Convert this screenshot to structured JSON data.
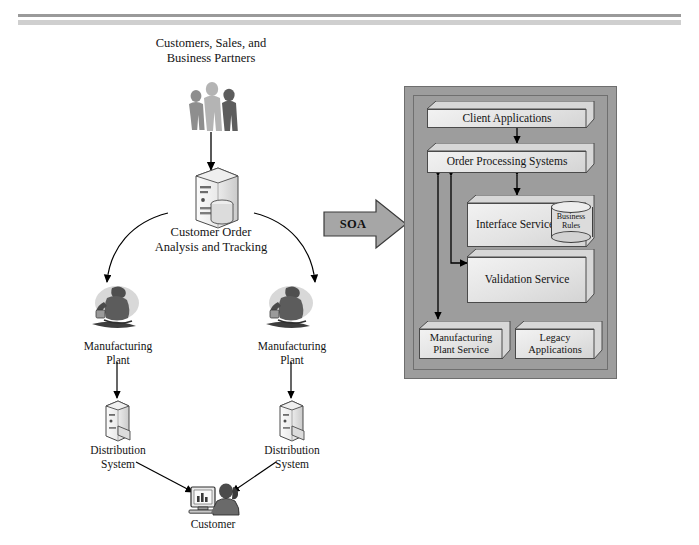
{
  "diagram": {
    "title_top_label": "Customers, Sales, and Business Partners",
    "left_flow": {
      "actors_label_line1": "Customers, Sales, and",
      "actors_label_line2": "Business Partners",
      "actors_icon": "three-people-icon",
      "central_system_line1": "Customer Order",
      "central_system_line2": "Analysis and Tracking",
      "central_system_icon": "server-tower-with-database-icon",
      "plant_left_line1": "Manufacturing",
      "plant_left_line2": "Plant",
      "plant_left_icon": "factory-worker-icon",
      "plant_right_line1": "Manufacturing",
      "plant_right_line2": "Plant",
      "plant_right_icon": "factory-worker-icon",
      "distribution_left_line1": "Distribution",
      "distribution_left_line2": "System",
      "distribution_left_icon": "server-tower-icon",
      "distribution_right_line1": "Distribution",
      "distribution_right_line2": "System",
      "distribution_right_icon": "server-tower-icon",
      "customer_label": "Customer",
      "customer_icon": "person-at-computer-icon"
    },
    "transition": {
      "label": "SOA",
      "icon": "right-block-arrow-icon"
    },
    "soa_panel": {
      "boxes": [
        {
          "id": "client-applications",
          "label": "Client Applications"
        },
        {
          "id": "order-processing-systems",
          "label": "Order Processing Systems"
        },
        {
          "id": "interface-service",
          "label": "Interface Service"
        },
        {
          "id": "validation-service",
          "label": "Validation Service"
        },
        {
          "id": "manufacturing-plant-service",
          "label_line1": "Manufacturing",
          "label_line2": "Plant Service"
        },
        {
          "id": "legacy-applications",
          "label_line1": "Legacy",
          "label_line2": "Applications"
        }
      ],
      "business_rules_store": {
        "line1": "Business",
        "line2": "Rules",
        "icon": "database-cylinder-icon"
      }
    },
    "colors": {
      "panel_background": "#9d9d9d",
      "box_fill": "#e8e8e8",
      "box_border": "#4a4a4a",
      "arrow": "#000000",
      "page_background": "#ffffff",
      "rule_dark": "#9a9a9a",
      "rule_light": "#cfcfcf"
    }
  }
}
